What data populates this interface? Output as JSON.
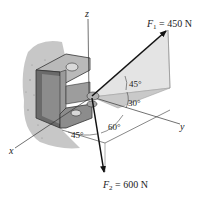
{
  "figure": {
    "type": "3D statics diagram",
    "axes": {
      "x": "x",
      "y": "y",
      "z": "z"
    },
    "forces": [
      {
        "symbol": "F",
        "subscript": "1",
        "equals": " = ",
        "value": "450 N",
        "label": "F1 = 450 N",
        "color": "#111111"
      },
      {
        "symbol": "F",
        "subscript": "2",
        "equals": " = ",
        "value": "600 N",
        "label": "F2 = 600 N",
        "color": "#111111"
      }
    ],
    "angles": {
      "f1_upper": "45°",
      "f1_lower": "30°",
      "f2_y": "60°",
      "f2_x": "45°"
    },
    "colors": {
      "wall": "#bdbdbd",
      "bracket_face": "#8c8c8c",
      "bracket_dark": "#6a6a6a",
      "bracket_light": "#b9b9b9",
      "plane_light": "#e4e4e4",
      "plane_dark": "#c9c9c9",
      "line": "#333333"
    }
  }
}
